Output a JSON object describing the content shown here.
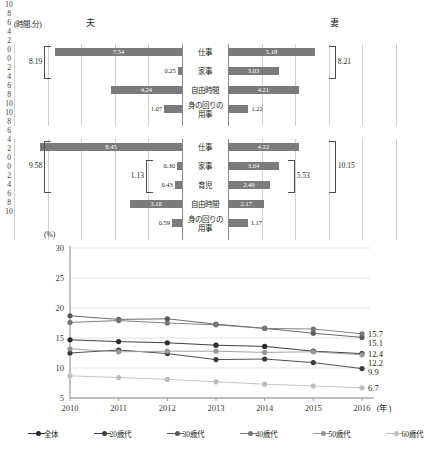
{
  "bar_charts": {
    "unit_label": "(時間.分)",
    "left_title": "夫",
    "right_title": "妻",
    "left_ticks": [
      "10",
      "8",
      "6",
      "4",
      "2",
      "0"
    ],
    "right_ticks": [
      "0",
      "2",
      "4",
      "6",
      "8",
      "10"
    ],
    "axis_max": 10,
    "chart1": {
      "categories": [
        "仕事",
        "家事",
        "自由時間",
        "身の回りの\n用事"
      ],
      "husband": [
        7.54,
        0.25,
        4.24,
        1.07
      ],
      "wife": [
        5.18,
        3.03,
        4.21,
        1.22
      ],
      "husband_labels": [
        "7.54",
        "0.25",
        "4.24",
        "1.07"
      ],
      "wife_labels": [
        "5.18",
        "3.03",
        "4.21",
        "1.22"
      ],
      "brackets": [
        {
          "side": "left",
          "label": "8.19",
          "from": 0,
          "to": 1
        },
        {
          "side": "right",
          "label": "8.21",
          "from": 0,
          "to": 1
        }
      ]
    },
    "chart2": {
      "categories": [
        "仕事",
        "家事",
        "育児",
        "自由時間",
        "身の回りの\n用事"
      ],
      "husband": [
        8.45,
        0.3,
        0.43,
        3.1,
        0.59
      ],
      "wife": [
        4.22,
        3.04,
        2.49,
        2.17,
        1.17
      ],
      "husband_labels": [
        "8.45",
        "0.30",
        "0.43",
        "3.10",
        "0.59"
      ],
      "wife_labels": [
        "4.22",
        "3.04",
        "2.49",
        "2.17",
        "1.17"
      ],
      "brackets": [
        {
          "side": "left",
          "label": "9.58",
          "from": 0,
          "to": 2
        },
        {
          "side": "left-inner",
          "label": "1.13",
          "from": 1,
          "to": 2
        },
        {
          "side": "right-inner",
          "label": "5.53",
          "from": 1,
          "to": 2
        },
        {
          "side": "right",
          "label": "10.15",
          "from": 0,
          "to": 2
        }
      ]
    }
  },
  "chart_data": {
    "type": "line",
    "title": "",
    "xlabel": "(年)",
    "ylabel": "(%)",
    "x": [
      "2010",
      "2011",
      "2012",
      "2013",
      "2014",
      "2015",
      "2016"
    ],
    "ylim": [
      5,
      30
    ],
    "yticks": [
      5,
      10,
      15,
      20,
      25,
      30
    ],
    "grid": true,
    "legend_position": "bottom",
    "series": [
      {
        "name": "全体",
        "color": "#2b2b2b",
        "values": [
          14.7,
          14.4,
          14.2,
          13.8,
          13.6,
          12.8,
          12.4
        ],
        "end_label": "12.4"
      },
      {
        "name": "20歳代",
        "color": "#3c3c3c",
        "values": [
          12.5,
          13.0,
          12.4,
          11.4,
          11.5,
          10.9,
          9.9
        ],
        "end_label": "9.9"
      },
      {
        "name": "30歳代",
        "color": "#5a5a5a",
        "values": [
          18.7,
          18.1,
          18.2,
          17.3,
          16.6,
          15.8,
          15.1
        ],
        "end_label": "15.1"
      },
      {
        "name": "40歳代",
        "color": "#757575",
        "values": [
          17.6,
          17.9,
          17.5,
          17.2,
          16.6,
          16.5,
          15.7
        ],
        "end_label": "15.7"
      },
      {
        "name": "50歳代",
        "color": "#989898",
        "values": [
          13.2,
          12.7,
          12.8,
          12.8,
          12.6,
          12.7,
          12.2
        ],
        "end_label": "12.2"
      },
      {
        "name": "60歳代",
        "color": "#bdbdbd",
        "values": [
          8.7,
          8.4,
          8.1,
          7.7,
          7.3,
          7.0,
          6.7
        ],
        "end_label": "6.7"
      }
    ]
  }
}
